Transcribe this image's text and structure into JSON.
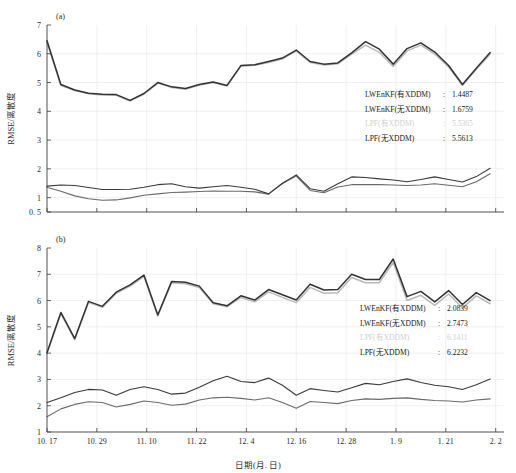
{
  "figure": {
    "background": "#ffffff",
    "width": 516,
    "height": 473
  },
  "axis": {
    "xlabel": "日期(月. 日)",
    "ylabel": "RMSE/离散度"
  },
  "panels": {
    "a": {
      "label": "(a)"
    },
    "b": {
      "label": "(b)"
    }
  },
  "colors": {
    "lwenkf_with": "#2a2a2a",
    "lwenkf_without": "#555555",
    "lpf_with": "#b9b9b9",
    "lpf_without": "#333333",
    "grid": "#e8e8e8",
    "axis": "#3c3c3c",
    "faded_text": "#cfcfcf"
  },
  "legend_a": {
    "rows": [
      {
        "name": "LWEnKF(有XDDM)",
        "sep": ":",
        "value": "1.4487",
        "faded": false
      },
      {
        "name": "LWEnKF(无XDDM)",
        "sep": ":",
        "value": "1.6759",
        "faded": false
      },
      {
        "name": "LPF(有XDDM)",
        "sep": ":",
        "value": "5.5365",
        "faded": true
      },
      {
        "name": "LPF(无XDDM)",
        "sep": ":",
        "value": "5.5613",
        "faded": false
      }
    ]
  },
  "legend_b": {
    "rows": [
      {
        "name": "LWEnKF(有XDDM)",
        "sep": ":",
        "value": "2.0839",
        "faded": false
      },
      {
        "name": "LWEnKF(无XDDM)",
        "sep": ":",
        "value": "2.7473",
        "faded": false
      },
      {
        "name": "LPF(有XDDM)",
        "sep": ":",
        "value": "6.1411",
        "faded": true
      },
      {
        "name": "LPF(无XDDM)",
        "sep": ":",
        "value": "6.2232",
        "faded": false
      }
    ]
  },
  "chart_data": [
    {
      "type": "line",
      "panel": "a",
      "title": "(a)",
      "xlabel": "日期(月. 日)",
      "ylabel": "RMSE/离散度",
      "grid": true,
      "legend_position": "inside-right",
      "ylim": [
        0.5,
        7
      ],
      "yticks": [
        0.5,
        1,
        2,
        3,
        4,
        5,
        6,
        7
      ],
      "ytick_labels": [
        "0. 5",
        "1",
        "2",
        "3",
        "4",
        "5",
        "6",
        "7"
      ],
      "xlim": [
        0,
        33
      ],
      "xticks": [
        0,
        3.6,
        7.2,
        10.8,
        14.4,
        18.0,
        21.6,
        25.2,
        28.8,
        32.4
      ],
      "xtick_labels": [
        "10. 17",
        "10. 29",
        "11. 10",
        "11. 22",
        "12. 4",
        "12. 16",
        "12. 28",
        "1. 9",
        "1. 21",
        "2. 2"
      ],
      "x": [
        0,
        1,
        2,
        3,
        4,
        5,
        6,
        7,
        8,
        9,
        10,
        11,
        12,
        13,
        14,
        15,
        16,
        17,
        18,
        19,
        20,
        21,
        22,
        23,
        24,
        25,
        26,
        27,
        28,
        29,
        30,
        31,
        32
      ],
      "series": [
        {
          "name": "LPF(无XDDM)",
          "color": "#333333",
          "width": 1.5,
          "values": [
            6.45,
            4.93,
            4.74,
            4.63,
            4.59,
            4.58,
            4.38,
            4.62,
            5.0,
            4.85,
            4.79,
            4.93,
            5.02,
            4.9,
            5.59,
            5.62,
            5.73,
            5.85,
            6.13,
            5.73,
            5.64,
            5.68,
            6.03,
            6.42,
            6.16,
            5.64,
            6.18,
            6.38,
            6.06,
            5.59,
            4.93,
            5.5,
            6.04
          ]
        },
        {
          "name": "LPF(有XDDM)",
          "color": "#b9b9b9",
          "width": 1.5,
          "values": [
            6.4,
            4.9,
            4.72,
            4.61,
            4.57,
            4.56,
            4.36,
            4.6,
            4.98,
            4.83,
            4.77,
            4.91,
            5.0,
            4.88,
            5.57,
            5.6,
            5.7,
            5.82,
            6.1,
            5.7,
            5.61,
            5.65,
            5.99,
            6.3,
            6.05,
            5.56,
            6.1,
            6.3,
            5.99,
            5.54,
            4.9,
            5.46,
            5.98
          ]
        },
        {
          "name": "LWEnKF(无XDDM)",
          "color": "#3a3a3a",
          "width": 1.1,
          "values": [
            1.4,
            1.44,
            1.42,
            1.35,
            1.28,
            1.28,
            1.29,
            1.36,
            1.45,
            1.48,
            1.38,
            1.33,
            1.38,
            1.42,
            1.36,
            1.29,
            1.13,
            1.5,
            1.79,
            1.31,
            1.22,
            1.48,
            1.72,
            1.7,
            1.65,
            1.61,
            1.55,
            1.63,
            1.72,
            1.63,
            1.54,
            1.73,
            2.02
          ]
        },
        {
          "name": "LWEnKF(有XDDM)",
          "color": "#6a6a6a",
          "width": 1.1,
          "values": [
            1.36,
            1.22,
            1.06,
            0.96,
            0.91,
            0.92,
            0.99,
            1.08,
            1.13,
            1.18,
            1.19,
            1.21,
            1.23,
            1.22,
            1.22,
            1.2,
            1.12,
            1.49,
            1.75,
            1.25,
            1.17,
            1.37,
            1.45,
            1.45,
            1.45,
            1.44,
            1.42,
            1.44,
            1.48,
            1.43,
            1.38,
            1.55,
            1.83
          ]
        }
      ]
    },
    {
      "type": "line",
      "panel": "b",
      "title": "(b)",
      "xlabel": "日期(月. 日)",
      "ylabel": "RMSE/离散度",
      "grid": true,
      "legend_position": "inside-right",
      "ylim": [
        1,
        8
      ],
      "yticks": [
        1,
        2,
        3,
        4,
        5,
        6,
        7,
        8
      ],
      "ytick_labels": [
        "1",
        "2",
        "3",
        "4",
        "5",
        "6",
        "7",
        "8"
      ],
      "xlim": [
        0,
        33
      ],
      "xticks": [
        0,
        3.6,
        7.2,
        10.8,
        14.4,
        18.0,
        21.6,
        25.2,
        28.8,
        32.4
      ],
      "xtick_labels": [
        "10. 17",
        "10. 29",
        "11. 10",
        "11. 22",
        "12. 4",
        "12. 16",
        "12. 28",
        "1. 9",
        "1. 21",
        "2. 2"
      ],
      "x": [
        0,
        1,
        2,
        3,
        4,
        5,
        6,
        7,
        8,
        9,
        10,
        11,
        12,
        13,
        14,
        15,
        16,
        17,
        18,
        19,
        20,
        21,
        22,
        23,
        24,
        25,
        26,
        27,
        28,
        29,
        30,
        31,
        32
      ],
      "series": [
        {
          "name": "LPF(无XDDM)",
          "color": "#333333",
          "width": 1.5,
          "values": [
            4.02,
            5.55,
            4.55,
            5.97,
            5.78,
            6.32,
            6.6,
            6.97,
            5.45,
            6.73,
            6.7,
            6.55,
            5.92,
            5.8,
            6.18,
            6.02,
            6.42,
            6.22,
            6.02,
            6.62,
            6.4,
            6.42,
            7.0,
            6.8,
            6.8,
            7.58,
            6.15,
            6.35,
            5.95,
            6.38,
            5.85,
            6.3,
            6.0
          ]
        },
        {
          "name": "LPF(有XDDM)",
          "color": "#b9b9b9",
          "width": 1.5,
          "values": [
            3.98,
            5.5,
            4.52,
            5.93,
            5.74,
            6.28,
            6.55,
            6.92,
            5.41,
            6.68,
            6.64,
            6.5,
            5.88,
            5.76,
            6.12,
            5.95,
            6.33,
            6.12,
            5.92,
            6.5,
            6.28,
            6.3,
            6.88,
            6.68,
            6.68,
            7.45,
            6.0,
            6.2,
            5.82,
            6.25,
            5.72,
            6.18,
            5.88
          ]
        },
        {
          "name": "LWEnKF(无XDDM)",
          "color": "#3a3a3a",
          "width": 1.1,
          "values": [
            2.12,
            2.3,
            2.5,
            2.62,
            2.6,
            2.4,
            2.62,
            2.72,
            2.62,
            2.44,
            2.48,
            2.7,
            2.95,
            3.12,
            2.92,
            2.88,
            3.05,
            2.78,
            2.4,
            2.65,
            2.58,
            2.52,
            2.68,
            2.85,
            2.8,
            2.92,
            3.02,
            2.88,
            2.78,
            2.72,
            2.62,
            2.8,
            3.02
          ]
        },
        {
          "name": "LWEnKF(有XDDM)",
          "color": "#6a6a6a",
          "width": 1.1,
          "values": [
            1.58,
            1.88,
            2.05,
            2.15,
            2.12,
            1.95,
            2.05,
            2.18,
            2.12,
            2.02,
            2.06,
            2.22,
            2.3,
            2.32,
            2.28,
            2.22,
            2.3,
            2.12,
            1.9,
            2.16,
            2.12,
            2.08,
            2.2,
            2.26,
            2.24,
            2.28,
            2.3,
            2.24,
            2.2,
            2.18,
            2.14,
            2.22,
            2.26
          ]
        }
      ]
    }
  ]
}
